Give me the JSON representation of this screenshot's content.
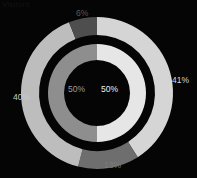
{
  "background_color": "#050505",
  "corner_label": "Visitors",
  "chart_data": {
    "type": "pie",
    "title": "",
    "subtitle": "",
    "xlabel": "",
    "ylabel": "",
    "legend_position": "none",
    "grid": false,
    "variant": "nested-donut",
    "center_x": 97,
    "center_y": 93,
    "start_angle_deg": 0,
    "direction": "clockwise",
    "rings": [
      {
        "name": "outer",
        "inner_radius": 58,
        "outer_radius": 76,
        "labels_outside": true,
        "slices": [
          {
            "label": "41%",
            "value": 41,
            "color": "#d5d5d5"
          },
          {
            "label": "13%",
            "value": 13,
            "color": "#6e6e6e"
          },
          {
            "label": "40%",
            "value": 40,
            "color": "#bdbdbd"
          },
          {
            "label": "6%",
            "value": 6,
            "color": "#4e4e4e"
          }
        ]
      },
      {
        "name": "inner",
        "inner_radius": 33,
        "outer_radius": 49,
        "labels_outside": false,
        "slices": [
          {
            "label": "50%",
            "value": 50,
            "color": "#e6e6e6"
          },
          {
            "label": "50%",
            "value": 50,
            "color": "#8e8e8e"
          }
        ]
      }
    ]
  },
  "labels": {
    "outer_right": "41%",
    "outer_bottom": "13%",
    "outer_left": "40%",
    "outer_top": "6%",
    "inner_right": "50%",
    "inner_left": "50%"
  }
}
